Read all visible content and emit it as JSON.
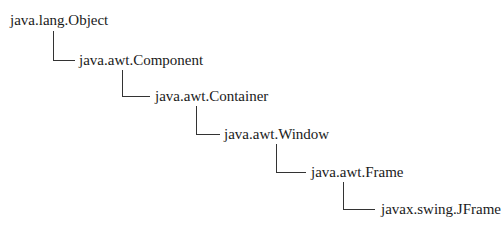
{
  "diagram": {
    "type": "class-hierarchy",
    "line_color": "#333333",
    "text_color": "#1a1a1a",
    "nodes": [
      {
        "id": "object",
        "label": "java.lang.Object",
        "x": 10,
        "y": 20
      },
      {
        "id": "component",
        "label": "java.awt.Component",
        "x": 79,
        "y": 60,
        "parent": "object"
      },
      {
        "id": "container",
        "label": "java.awt.Container",
        "x": 155,
        "y": 96,
        "parent": "component"
      },
      {
        "id": "window",
        "label": "java.awt.Window",
        "x": 224,
        "y": 134,
        "parent": "container"
      },
      {
        "id": "frame",
        "label": "java.awt.Frame",
        "x": 311,
        "y": 172,
        "parent": "window"
      },
      {
        "id": "jframe",
        "label": "javax.swing.JFrame",
        "x": 381,
        "y": 209,
        "parent": "frame"
      }
    ]
  }
}
